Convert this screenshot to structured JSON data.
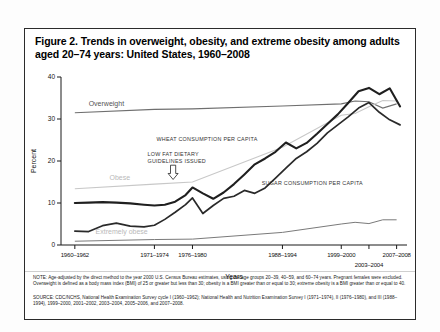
{
  "figure": {
    "title": "Figure 2. Trends in overweight, obesity, and extreme obesity among adults aged 20–74 years: United States, 1960–2008",
    "note": "NOTE: Age-adjusted by the direct method to the year 2000 U.S. Census Bureau estimates, using the age groups 20–39, 40–59, and 60–74 years. Pregnant females were excluded. Overweight is defined as a body mass index (BMI) of 25 or greater but less than 30; obesity is a BMI greater than or equal to 30; extreme obesity is a BMI greater than or equal to 40.",
    "source": "SOURCE: CDC/NCHS, National Health Examination Survey cycle I (1960–1962); National Health and Nutrition Examination Survey I (1971–1974), II (1976–1980), and III (1988–1994), 1999–2000, 2001–2002, 2003–2004, 2005–2006, and 2007–2008."
  },
  "chart_data": {
    "type": "line",
    "title": "Figure 2. Trends in overweight, obesity, and extreme obesity among adults aged 20–74 years: United States, 1960–2008",
    "xlabel": "Years",
    "ylabel": "Percent",
    "ylim": [
      0,
      40
    ],
    "yticks": [
      0,
      10,
      20,
      30,
      40
    ],
    "grid": false,
    "legend_position": "inline-labels",
    "x_tick_labels": [
      "1960–1962",
      "1971–1974",
      "1976–1980",
      "1988–1994",
      "1999–2000",
      "2003–2004",
      "2007–2008"
    ],
    "x_tick_positions": [
      1961,
      1972.5,
      1978,
      1991,
      1999.5,
      2003.5,
      2007.5
    ],
    "xlim": [
      1959,
      2009
    ],
    "series": [
      {
        "name": "Overweight",
        "color": "#6f6f6f",
        "label_x": 1963,
        "label_y": 33.2,
        "x": [
          1961,
          1972.5,
          1978,
          1991,
          1999.5,
          2001.5,
          2003.5,
          2005.5,
          2007.5
        ],
        "values": [
          31.5,
          32.3,
          32.4,
          33.1,
          33.6,
          34.3,
          34.1,
          32.6,
          33.6
        ]
      },
      {
        "name": "Obese",
        "color": "#c8c8c8",
        "label_x": 1966,
        "label_y": 15.5,
        "x": [
          1961,
          1972.5,
          1978,
          1991,
          1999.5,
          2001.5,
          2003.5,
          2005.5,
          2007.5
        ],
        "values": [
          13.4,
          14.5,
          15.0,
          23.3,
          30.9,
          31.3,
          32.9,
          34.4,
          34.3
        ]
      },
      {
        "name": "Extremely obese",
        "color": "#7a7a7a",
        "label_x": 1964,
        "label_y": 2.6,
        "x": [
          1961,
          1972.5,
          1978,
          1991,
          1999.5,
          2001.5,
          2003.5,
          2005.5,
          2007.5
        ],
        "values": [
          0.9,
          1.3,
          1.4,
          3.0,
          5.0,
          5.4,
          5.1,
          6.0,
          6.0
        ]
      },
      {
        "name": "WHEAT CONSUMPTION PER CAPITA",
        "color": "#1f1f1f",
        "label_x": 1972.8,
        "label_y": 24.8,
        "x": [
          1961,
          1963,
          1965,
          1967,
          1969,
          1971,
          1972.5,
          1974,
          1975.5,
          1977,
          1978,
          1979.5,
          1981,
          1982.5,
          1984,
          1985.5,
          1987,
          1988.5,
          1990,
          1991.5,
          1993,
          1994.5,
          1996,
          1997.5,
          1999,
          2000.5,
          2002,
          2003.5,
          2005,
          2006.5,
          2008
        ],
        "values": [
          10.0,
          10.1,
          10.2,
          10.1,
          9.9,
          9.6,
          9.4,
          9.6,
          10.3,
          11.9,
          13.7,
          12.3,
          11.0,
          12.5,
          14.5,
          16.8,
          19.2,
          20.6,
          22.2,
          24.4,
          23.0,
          24.3,
          26.5,
          28.8,
          31.1,
          33.8,
          36.6,
          37.4,
          35.9,
          37.3,
          33.0
        ]
      },
      {
        "name": "SUGAR CONSUMPTION PER CAPITA",
        "color": "#2a2a2a",
        "label_x": 1988,
        "label_y": 14.2,
        "x": [
          1961,
          1963,
          1965,
          1967,
          1969,
          1971,
          1972.5,
          1974,
          1975.5,
          1977,
          1978,
          1979.5,
          1981,
          1982.5,
          1984,
          1985.5,
          1987,
          1988.5,
          1990,
          1991.5,
          1993,
          1994.5,
          1996,
          1997.5,
          1999,
          2000.5,
          2002,
          2003.5,
          2005,
          2006.5,
          2008
        ],
        "values": [
          3.3,
          3.2,
          4.6,
          5.2,
          4.5,
          4.3,
          4.7,
          6.1,
          7.8,
          9.6,
          11.2,
          7.5,
          9.4,
          11.1,
          11.6,
          13.0,
          12.3,
          13.6,
          15.9,
          18.3,
          20.6,
          22.2,
          24.2,
          26.7,
          28.6,
          30.5,
          32.6,
          33.9,
          31.6,
          29.8,
          28.6
        ]
      }
    ],
    "annotations": [
      {
        "id": "wheat-consumption",
        "text": "WHEAT CONSUMPTION PER CAPITA",
        "x": 1972.8,
        "y": 24.8
      },
      {
        "id": "low-fat-guidelines",
        "text_line1": "LOW FAT DIETARY",
        "text_line2": "GUIDELINES ISSUED",
        "x": 1971.5,
        "y": 21.3,
        "arrow_x": 1975.2,
        "arrow_y_top": 19.0,
        "arrow_y_bottom": 15.6
      },
      {
        "id": "sugar-consumption",
        "text": "SUGAR CONSUMPTION PER CAPITA",
        "x": 1988,
        "y": 14.2
      }
    ]
  }
}
